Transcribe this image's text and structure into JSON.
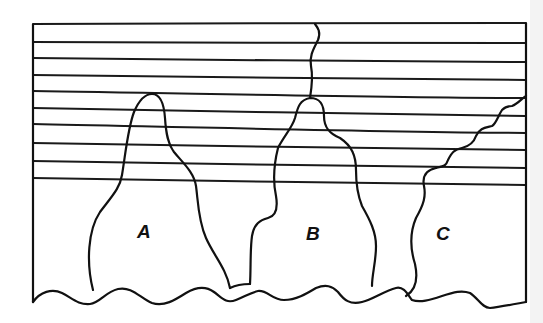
{
  "diagram": {
    "type": "schematic cross-section",
    "grains": [
      {
        "id": "A",
        "label": "A"
      },
      {
        "id": "B",
        "label": "B"
      },
      {
        "id": "C",
        "label": "C"
      }
    ],
    "layer_line_count": 10,
    "colors": {
      "ink": "#111111",
      "background": "#ffffff"
    }
  }
}
